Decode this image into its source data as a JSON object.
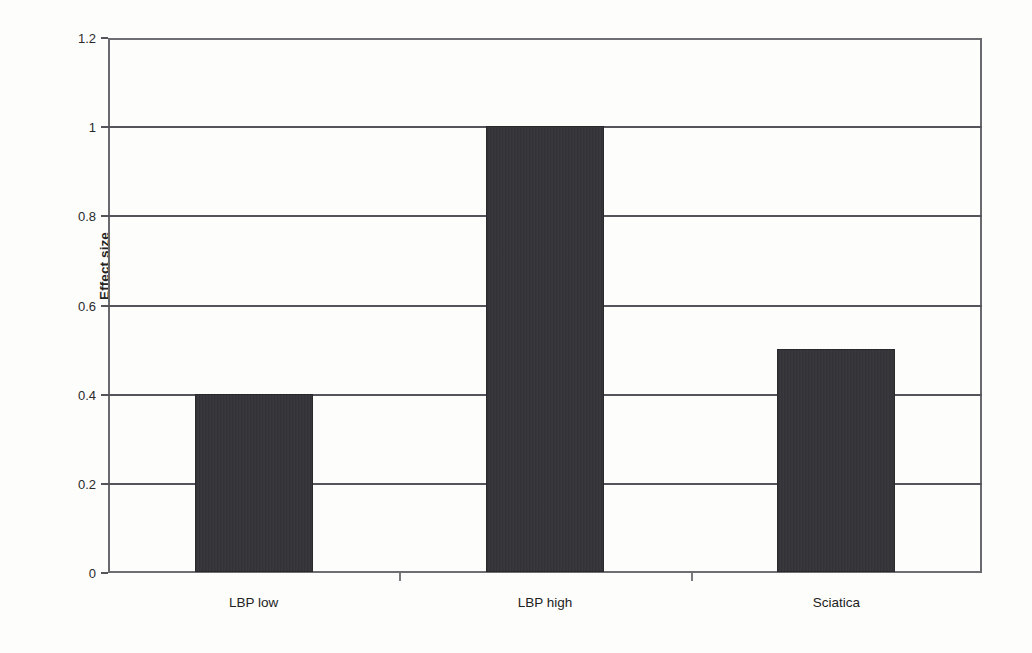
{
  "chart_data": {
    "type": "bar",
    "title": "",
    "subtitle": "",
    "xlabel": "",
    "ylabel": "Effect size",
    "categories": [
      "LBP low",
      "LBP high",
      "Sciatica"
    ],
    "values": [
      0.4,
      1.0,
      0.5
    ],
    "series": [
      {
        "name": "Effect size",
        "values": [
          0.4,
          1.0,
          0.5
        ]
      }
    ],
    "ylim": [
      0,
      1.2
    ],
    "ytick_values": [
      0,
      0.2,
      0.4,
      0.6,
      0.8,
      1,
      1.2
    ],
    "ytick_labels": [
      "0",
      "0.2",
      "0.4",
      "0.6",
      "0.8",
      "1",
      "1.2"
    ],
    "grid": "horizontal",
    "legend": "none",
    "bar_color": "#343438",
    "axis_color": "#54545a",
    "background_color": "#fdfdfc",
    "annotations": []
  },
  "axis": {
    "y_title": "Effect size"
  }
}
